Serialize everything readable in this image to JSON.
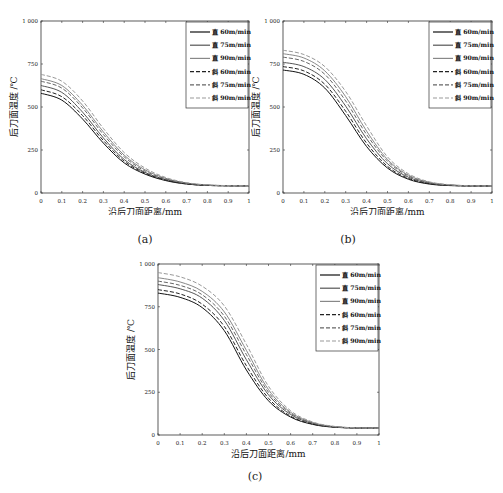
{
  "figure": {
    "captions": [
      "(a)",
      "(b)",
      "(c)"
    ]
  },
  "chart_data": [
    {
      "type": "line",
      "panel": "(a)",
      "xlabel": "沿后刀面距离/mm",
      "ylabel": "后刀面温度 /℃",
      "xlim": [
        0,
        1
      ],
      "ylim": [
        0,
        1000
      ],
      "xticks": [
        "0",
        "0.1",
        "0.2",
        "0.3",
        "0.4",
        "0.5",
        "0.6",
        "0.7",
        "0.8",
        "0.9",
        "1"
      ],
      "yticks": [
        "0",
        "250",
        "500",
        "750",
        "1 000"
      ],
      "grid": false,
      "legend_position": "upper right",
      "x": [
        0,
        0.1,
        0.2,
        0.3,
        0.4,
        0.5,
        0.6,
        0.7,
        0.8,
        0.9,
        1.0
      ],
      "series": [
        {
          "name": "直 60m/min",
          "style": "solid",
          "color": "#111111",
          "values": [
            580,
            540,
            430,
            290,
            175,
            110,
            72,
            52,
            44,
            42,
            42
          ]
        },
        {
          "name": "直 75m/min",
          "style": "solid",
          "color": "#555555",
          "values": [
            625,
            585,
            470,
            320,
            195,
            120,
            78,
            55,
            45,
            42,
            42
          ]
        },
        {
          "name": "直 90m/min",
          "style": "solid",
          "color": "#888888",
          "values": [
            665,
            625,
            510,
            355,
            220,
            135,
            85,
            58,
            46,
            43,
            42
          ]
        },
        {
          "name": "斜 60m/min",
          "style": "dashed",
          "color": "#222222",
          "values": [
            600,
            560,
            450,
            305,
            185,
            115,
            75,
            53,
            44,
            42,
            42
          ]
        },
        {
          "name": "斜 75m/min",
          "style": "dashed",
          "color": "#666666",
          "values": [
            650,
            610,
            495,
            340,
            210,
            128,
            82,
            57,
            46,
            43,
            42
          ]
        },
        {
          "name": "斜 90m/min",
          "style": "dashed",
          "color": "#999999",
          "values": [
            690,
            650,
            535,
            375,
            235,
            145,
            90,
            60,
            47,
            43,
            42
          ]
        }
      ]
    },
    {
      "type": "line",
      "panel": "(b)",
      "xlabel": "沿后刀面距离/mm",
      "ylabel": "后刀面温度 /℃",
      "xlim": [
        0,
        1
      ],
      "ylim": [
        0,
        1000
      ],
      "xticks": [
        "0",
        "0.1",
        "0.2",
        "0.3",
        "0.4",
        "0.5",
        "0.6",
        "0.7",
        "0.8",
        "0.9",
        "1"
      ],
      "yticks": [
        "0",
        "250",
        "500",
        "750",
        "1 000"
      ],
      "grid": false,
      "legend_position": "upper right",
      "x": [
        0,
        0.1,
        0.2,
        0.3,
        0.4,
        0.5,
        0.6,
        0.7,
        0.8,
        0.9,
        1.0
      ],
      "series": [
        {
          "name": "直 60m/min",
          "style": "solid",
          "color": "#111111",
          "values": [
            715,
            690,
            610,
            450,
            270,
            145,
            80,
            52,
            43,
            41,
            41
          ]
        },
        {
          "name": "直 75m/min",
          "style": "solid",
          "color": "#555555",
          "values": [
            760,
            735,
            660,
            505,
            315,
            170,
            92,
            57,
            45,
            42,
            41
          ]
        },
        {
          "name": "直 90m/min",
          "style": "solid",
          "color": "#888888",
          "values": [
            810,
            785,
            710,
            560,
            360,
            195,
            104,
            62,
            47,
            42,
            41
          ]
        },
        {
          "name": "斜 60m/min",
          "style": "dashed",
          "color": "#222222",
          "values": [
            735,
            710,
            632,
            475,
            290,
            155,
            85,
            54,
            44,
            41,
            41
          ]
        },
        {
          "name": "斜 75m/min",
          "style": "dashed",
          "color": "#666666",
          "values": [
            790,
            765,
            690,
            535,
            340,
            185,
            99,
            60,
            46,
            42,
            41
          ]
        },
        {
          "name": "斜 90m/min",
          "style": "dashed",
          "color": "#999999",
          "values": [
            830,
            805,
            735,
            590,
            390,
            210,
            112,
            65,
            48,
            42,
            41
          ]
        }
      ]
    },
    {
      "type": "line",
      "panel": "(c)",
      "xlabel": "沿后刀面距离/mm",
      "ylabel": "后刀面温度 /℃",
      "xlim": [
        0,
        1
      ],
      "ylim": [
        0,
        1000
      ],
      "xticks": [
        "0",
        "0.1",
        "0.2",
        "0.3",
        "0.4",
        "0.5",
        "0.6",
        "0.7",
        "0.8",
        "0.9",
        "1"
      ],
      "yticks": [
        "0",
        "250",
        "500",
        "750",
        "1 000"
      ],
      "grid": false,
      "legend_position": "upper right",
      "x": [
        0,
        0.1,
        0.2,
        0.3,
        0.4,
        0.5,
        0.6,
        0.7,
        0.8,
        0.9,
        1.0
      ],
      "series": [
        {
          "name": "直 60m/min",
          "style": "solid",
          "color": "#111111",
          "values": [
            830,
            805,
            745,
            610,
            380,
            200,
            105,
            62,
            45,
            41,
            40
          ]
        },
        {
          "name": "直 75m/min",
          "style": "solid",
          "color": "#555555",
          "values": [
            880,
            855,
            800,
            670,
            440,
            235,
            120,
            68,
            47,
            42,
            40
          ]
        },
        {
          "name": "直 90m/min",
          "style": "solid",
          "color": "#888888",
          "values": [
            920,
            895,
            840,
            720,
            495,
            265,
            133,
            73,
            49,
            42,
            40
          ]
        },
        {
          "name": "斜 60m/min",
          "style": "dashed",
          "color": "#222222",
          "values": [
            850,
            825,
            765,
            635,
            405,
            215,
            110,
            64,
            46,
            41,
            40
          ]
        },
        {
          "name": "斜 75m/min",
          "style": "dashed",
          "color": "#666666",
          "values": [
            900,
            875,
            820,
            695,
            470,
            250,
            127,
            70,
            48,
            42,
            40
          ]
        },
        {
          "name": "斜 90m/min",
          "style": "dashed",
          "color": "#999999",
          "values": [
            950,
            925,
            870,
            755,
            530,
            285,
            142,
            76,
            50,
            42,
            40
          ]
        }
      ]
    }
  ]
}
